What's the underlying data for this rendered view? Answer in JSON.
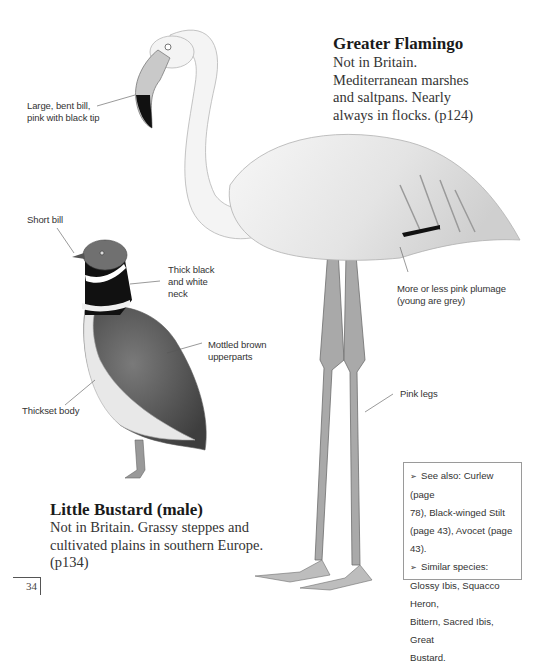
{
  "page_number": "34",
  "flamingo": {
    "title": "Greater Flamingo",
    "description_lines": [
      "Not in Britain.",
      "Mediterranean marshes",
      "and saltpans. Nearly",
      "always in flocks. (p124)"
    ],
    "labels": {
      "bill": [
        "Large, bent bill,",
        "pink with black tip"
      ],
      "plumage": [
        "More or less pink plumage",
        "(young are grey)"
      ],
      "legs": "Pink legs"
    }
  },
  "bustard": {
    "title": "Little Bustard (male)",
    "description_lines": [
      "Not in Britain. Grassy steppes and",
      "cultivated plains in southern Europe.",
      "(p134)"
    ],
    "labels": {
      "bill": "Short bill",
      "neck": [
        "Thick black",
        "and white",
        "neck"
      ],
      "upperparts": [
        "Mottled brown",
        "upperparts"
      ],
      "body": "Thickset body"
    }
  },
  "infobox": {
    "bullet_icon": "arrowhead-bullet-icon",
    "bullet_glyph": "➢",
    "lines": [
      {
        "bullet": true,
        "text": "See also: Curlew (page"
      },
      {
        "bullet": false,
        "text": "78), Black-winged Stilt"
      },
      {
        "bullet": false,
        "text": "(page 43), Avocet (page 43)."
      },
      {
        "bullet": true,
        "text": "Similar species:"
      },
      {
        "bullet": false,
        "text": "Glossy Ibis, Squacco Heron,"
      },
      {
        "bullet": false,
        "text": "Bittern, Sacred Ibis, Great"
      },
      {
        "bullet": false,
        "text": "Bustard."
      }
    ]
  }
}
